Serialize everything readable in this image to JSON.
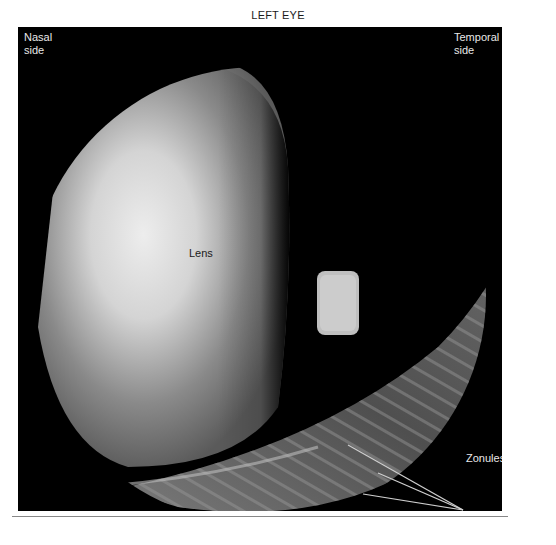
{
  "figure": {
    "title": "LEFT EYE",
    "labels": {
      "nasal_line1": "Nasal",
      "nasal_line2": "side",
      "temporal_line1": "Temporal",
      "temporal_line2": "side",
      "lens": "Lens",
      "pupil": "Pupil",
      "zonules": "Zonules"
    },
    "colors": {
      "background": "#000000",
      "lens_bright": "#e6e6e6",
      "lens_mid": "#8a8a8a",
      "zonule_band": "#5a5a5a",
      "annotation_line": "#c8c8c8"
    }
  }
}
